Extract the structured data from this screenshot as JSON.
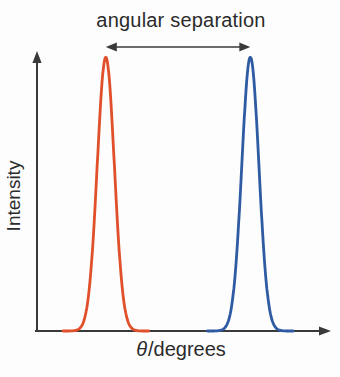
{
  "axes": {
    "ylabel": "Intensity",
    "xlabel_symbol": "θ",
    "xlabel_rest": "/degrees"
  },
  "colors": {
    "background": "#fdfdfd",
    "axis": "#3a3a3a",
    "text": "#2b2b2b",
    "peak1": "#e0502b",
    "peak2": "#2f5ba3"
  },
  "chart_data": {
    "type": "line",
    "title": "",
    "xlabel": "θ/degrees",
    "ylabel": "Intensity",
    "x_range": [
      0,
      1
    ],
    "y_range": [
      0,
      1
    ],
    "grid": false,
    "legend": "none",
    "axis_numbers": "none",
    "annotation": {
      "text": "angular separation",
      "shape": "double-headed-arrow",
      "from_x": 0.24,
      "to_x": 0.73
    },
    "series": [
      {
        "name": "peak-1-orange",
        "shape": "gaussian",
        "color": "#e0502b",
        "center": 0.24,
        "sigma": 0.029,
        "amplitude": 0.985
      },
      {
        "name": "peak-2-blue",
        "shape": "gaussian",
        "color": "#2f5ba3",
        "center": 0.73,
        "sigma": 0.029,
        "amplitude": 0.985
      }
    ]
  }
}
